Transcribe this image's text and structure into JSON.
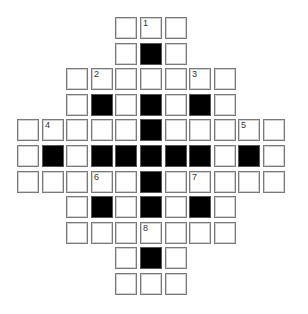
{
  "puzzle": {
    "type": "crossword",
    "cols": 11,
    "rows": 11,
    "layout": [
      "....WWW....",
      "....WBW....",
      "..WWWWWWW..",
      "..WBWBWBW..",
      "WWWWWBWWWWW",
      "WBWBBBBBWBW",
      "WWWWWBWWWWW",
      "..WBWBWBW..",
      "..WWWWWWW..",
      "....WBW....",
      "....WWW...."
    ],
    "numbers": [
      {
        "row": 0,
        "col": 5,
        "n": "1"
      },
      {
        "row": 2,
        "col": 3,
        "n": "2"
      },
      {
        "row": 2,
        "col": 7,
        "n": "3"
      },
      {
        "row": 4,
        "col": 1,
        "n": "4"
      },
      {
        "row": 4,
        "col": 9,
        "n": "5"
      },
      {
        "row": 6,
        "col": 3,
        "n": "6"
      },
      {
        "row": 6,
        "col": 7,
        "n": "7"
      },
      {
        "row": 8,
        "col": 5,
        "n": "8"
      }
    ],
    "colors": {
      "white": "#ffffff",
      "black": "#000000",
      "border": "#7a7a7a"
    }
  }
}
